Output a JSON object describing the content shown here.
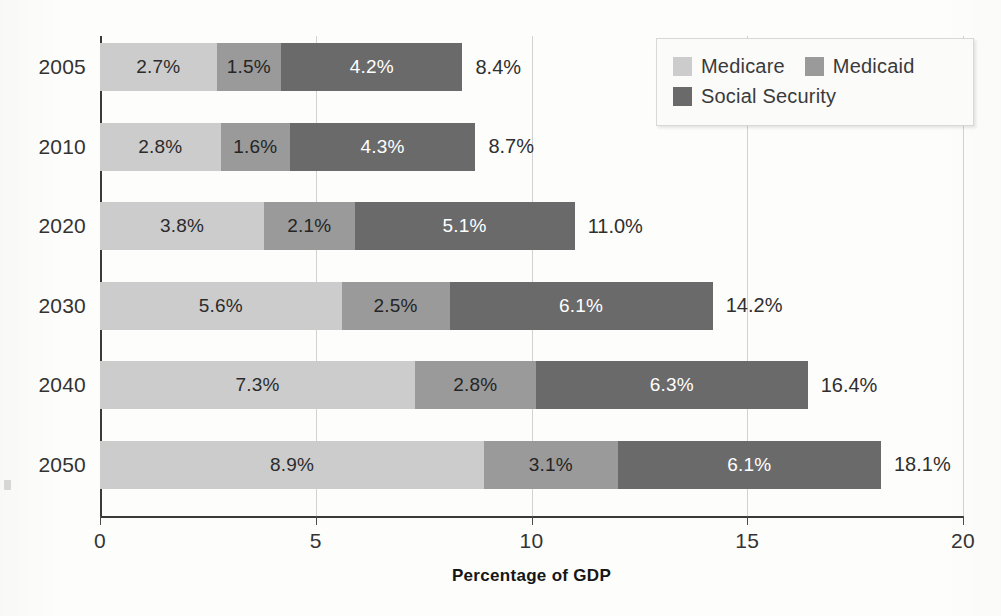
{
  "chart_data": {
    "type": "bar",
    "orientation": "horizontal",
    "stacked": true,
    "title": "",
    "subtitle": "",
    "xlabel": "Percentage of GDP",
    "ylabel": "",
    "xlim": [
      0,
      20
    ],
    "xticks": [
      "0",
      "5",
      "10",
      "15",
      "20"
    ],
    "xtick_values": [
      0,
      5,
      10,
      15,
      20
    ],
    "grid": "vertical",
    "legend_position": "top-right",
    "categories": [
      "2005",
      "2010",
      "2020",
      "2030",
      "2040",
      "2050"
    ],
    "series": [
      {
        "name": "Medicare",
        "key": "medicare",
        "color": "#cccccc",
        "values": [
          2.7,
          2.8,
          3.8,
          5.6,
          7.3,
          8.9
        ],
        "labels": [
          "2.7%",
          "2.8%",
          "3.8%",
          "5.6%",
          "7.3%",
          "8.9%"
        ]
      },
      {
        "name": "Medicaid",
        "key": "medicaid",
        "color": "#9a9a9a",
        "values": [
          1.5,
          1.6,
          2.1,
          2.5,
          2.8,
          3.1
        ],
        "labels": [
          "1.5%",
          "1.6%",
          "2.1%",
          "2.5%",
          "2.8%",
          "3.1%"
        ]
      },
      {
        "name": "Social Security",
        "key": "social_security",
        "color": "#6a6a6a",
        "values": [
          4.2,
          4.3,
          5.1,
          6.1,
          6.3,
          6.1
        ],
        "labels": [
          "4.2%",
          "4.3%",
          "5.1%",
          "6.1%",
          "6.3%",
          "6.1%"
        ]
      }
    ],
    "totals": [
      8.4,
      8.7,
      11.0,
      14.2,
      16.4,
      18.1
    ],
    "total_labels": [
      "8.4%",
      "8.7%",
      "11.0%",
      "14.2%",
      "16.4%",
      "18.1%"
    ]
  },
  "legend": {
    "entries": [
      {
        "label": "Medicare",
        "color": "#cccccc"
      },
      {
        "label": "Medicaid",
        "color": "#9a9a9a"
      },
      {
        "label": "Social Security",
        "color": "#6a6a6a"
      }
    ]
  },
  "colors": {
    "medicare": "#cccccc",
    "medicaid": "#9a9a9a",
    "social_security": "#6a6a6a",
    "axis": "#3a3a3a",
    "gridline": "#d2d2d2",
    "background": "#fdfdfc"
  }
}
